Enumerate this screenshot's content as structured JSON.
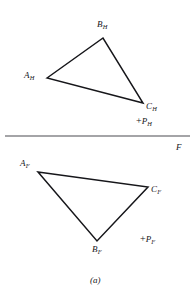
{
  "figure": {
    "caption": "(a)",
    "background_color": "#ffffff",
    "ink_color": "#16161a",
    "width": 196,
    "height": 302
  },
  "fold_line": {
    "label": "F",
    "label_x": 176,
    "label_y": 143,
    "x1": 5,
    "y1": 136,
    "x2": 190,
    "y2": 136,
    "stroke_width": 1.2
  },
  "top_view": {
    "name": "horizontal-projection-triangle",
    "stroke_width": 1.5,
    "vertices": [
      {
        "id": "A_H",
        "letter": "A",
        "subscript": "H",
        "x": 47,
        "y": 78,
        "label_x": 24,
        "label_y": 71
      },
      {
        "id": "B_H",
        "letter": "B",
        "subscript": "H",
        "x": 103,
        "y": 38,
        "label_x": 97,
        "label_y": 20
      },
      {
        "id": "C_H",
        "letter": "C",
        "subscript": "H",
        "x": 143,
        "y": 103,
        "label_x": 146,
        "label_y": 102
      }
    ],
    "point": {
      "id": "P_H",
      "symbol": "+",
      "letter": "P",
      "subscript": "H",
      "label_x": 136,
      "label_y": 116
    }
  },
  "front_view": {
    "name": "frontal-projection-triangle",
    "stroke_width": 1.5,
    "vertices": [
      {
        "id": "A_F",
        "letter": "A",
        "subscript": "F",
        "x": 38,
        "y": 172,
        "label_x": 20,
        "label_y": 159
      },
      {
        "id": "C_F",
        "letter": "C",
        "subscript": "F",
        "x": 148,
        "y": 187,
        "label_x": 151,
        "label_y": 185
      },
      {
        "id": "B_F",
        "letter": "B",
        "subscript": "F",
        "x": 97,
        "y": 241,
        "label_x": 92,
        "label_y": 245
      }
    ],
    "point": {
      "id": "P_F",
      "symbol": "+",
      "letter": "P",
      "subscript": "F",
      "label_x": 140,
      "label_y": 234
    }
  },
  "caption_position": {
    "x": 90,
    "y": 276
  }
}
